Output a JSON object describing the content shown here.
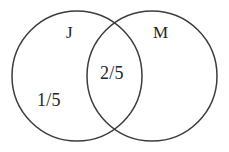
{
  "figure": {
    "type": "venn-diagram",
    "set_count": 2,
    "background_color": "#ffffff",
    "stroke_color": "#3b3b42",
    "text_color": "#24242a"
  },
  "sets": [
    {
      "id": "j",
      "label": "J",
      "position": "left"
    },
    {
      "id": "m",
      "label": "M",
      "position": "right"
    }
  ],
  "regions": [
    {
      "id": "j-only",
      "label": "1/5",
      "description": "left circle only"
    },
    {
      "id": "intersection",
      "label": "2/5",
      "description": "overlap of J and M"
    }
  ],
  "geometry": {
    "left_circle": {
      "cx": 77,
      "cy": 76,
      "r": 65
    },
    "right_circle": {
      "cx": 152,
      "cy": 76,
      "r": 65
    }
  }
}
